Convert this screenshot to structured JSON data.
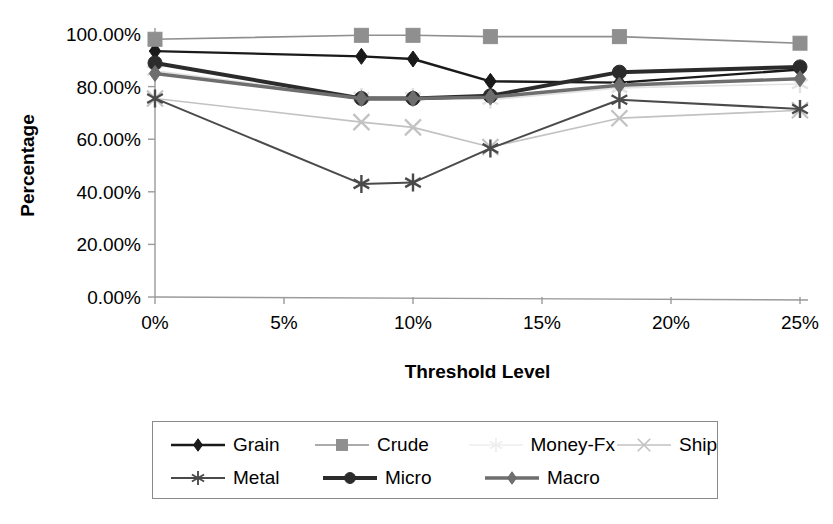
{
  "chart_data": {
    "type": "line",
    "title": "",
    "xlabel": "Threshold Level",
    "ylabel": "Percentage",
    "x": [
      0,
      8,
      10,
      13,
      18,
      25
    ],
    "xtick_labels": [
      "0%",
      "5%",
      "10%",
      "15%",
      "20%",
      "25%"
    ],
    "xtick_values": [
      0,
      5,
      10,
      15,
      20,
      25
    ],
    "xlim": [
      0,
      25
    ],
    "ytick_labels": [
      "0.00%",
      "20.00%",
      "40.00%",
      "60.00%",
      "80.00%",
      "100.00%"
    ],
    "ytick_values": [
      0,
      20,
      40,
      60,
      80,
      100
    ],
    "ylim": [
      0,
      100
    ],
    "grid": false,
    "legend_position": "bottom",
    "series": [
      {
        "name": "Grain",
        "marker": "diamond",
        "color": "#1a1a1a",
        "width": 2.4,
        "values": [
          93.5,
          91.5,
          90.5,
          82.0,
          81.5,
          86.5
        ]
      },
      {
        "name": "Crude",
        "marker": "square",
        "color": "#8f8f8f",
        "width": 1.6,
        "values": [
          98.0,
          99.5,
          99.5,
          99.0,
          99.0,
          96.5
        ]
      },
      {
        "name": "Money-Fx",
        "marker": "star",
        "color": "#e2e2e2",
        "width": 1.6,
        "values": [
          86.0,
          76.0,
          76.0,
          75.0,
          79.5,
          81.0
        ]
      },
      {
        "name": "Ship",
        "marker": "cross",
        "color": "#c2c2c2",
        "width": 1.6,
        "values": [
          75.5,
          66.5,
          64.5,
          57.0,
          68.0,
          71.0
        ]
      },
      {
        "name": "Metal",
        "marker": "star",
        "color": "#4a4a4a",
        "width": 2.0,
        "values": [
          75.5,
          43.0,
          43.5,
          56.5,
          75.0,
          71.5
        ]
      },
      {
        "name": "Micro",
        "marker": "circle",
        "color": "#2b2b2b",
        "width": 4.0,
        "values": [
          89.0,
          75.5,
          75.5,
          76.5,
          85.5,
          87.5
        ]
      },
      {
        "name": "Macro",
        "marker": "diamond",
        "color": "#6e6e6e",
        "width": 3.4,
        "values": [
          85.0,
          75.5,
          75.5,
          76.0,
          80.5,
          83.0
        ]
      }
    ]
  },
  "legend": {
    "rows": [
      [
        "Grain",
        "Crude",
        "Money-Fx",
        "Ship"
      ],
      [
        "Metal",
        "Micro",
        "Macro"
      ]
    ]
  }
}
